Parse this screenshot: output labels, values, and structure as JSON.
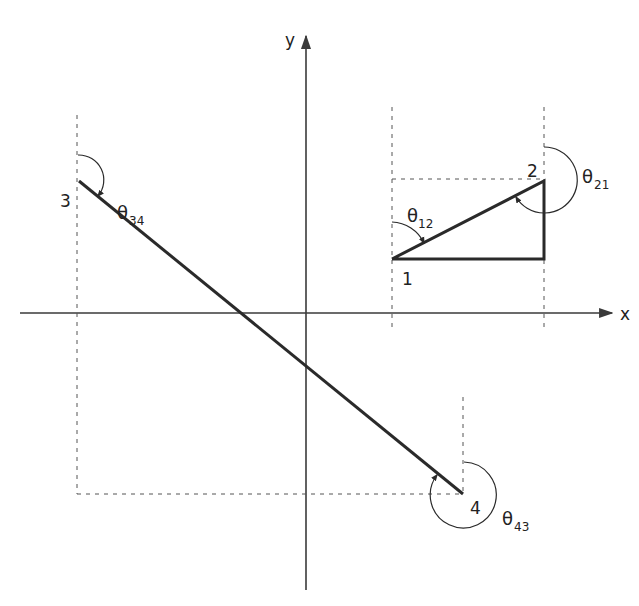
{
  "axes": {
    "x_label": "x",
    "y_label": "y"
  },
  "points": [
    {
      "id": "1",
      "label": "1"
    },
    {
      "id": "2",
      "label": "2"
    },
    {
      "id": "3",
      "label": "3"
    },
    {
      "id": "4",
      "label": "4"
    }
  ],
  "angles": [
    {
      "symbol": "θ",
      "subscript": "12"
    },
    {
      "symbol": "θ",
      "subscript": "21"
    },
    {
      "symbol": "θ",
      "subscript": "34"
    },
    {
      "symbol": "θ",
      "subscript": "43"
    }
  ],
  "colors": {
    "line": "#2a2a2a",
    "axis": "#3a3a3a",
    "dashed": "#555555",
    "background": "#ffffff"
  }
}
